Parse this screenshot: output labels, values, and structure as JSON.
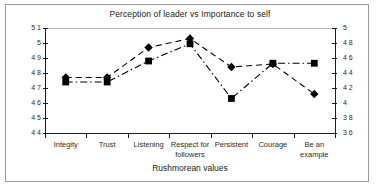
{
  "figure": {
    "border_color": "#9a9a9a",
    "background": "#ffffff"
  },
  "chart_data": {
    "type": "line",
    "title": "Perception of leader vs Importance to self",
    "xlabel": "Rushmorean values",
    "ylabel": "",
    "categories": [
      "Integity",
      "Trust",
      "Listening",
      "Respect for followers",
      "Persistent",
      "Courage",
      "Be an example"
    ],
    "series": [
      {
        "name": "Perception of leader",
        "marker": "diamond",
        "axis": "left",
        "line_style": "dashed",
        "color": "#000000",
        "values": [
          4.77,
          4.77,
          4.97,
          5.03,
          4.84,
          4.86,
          4.66
        ]
      },
      {
        "name": "Importance to self",
        "marker": "square",
        "axis": "right",
        "line_style": "dash-dot",
        "color": "#000000",
        "values": [
          4.28,
          4.28,
          4.56,
          4.79,
          4.06,
          4.53,
          4.53
        ]
      }
    ],
    "left_axis": {
      "min": 4.4,
      "max": 5.1,
      "ticks": [
        "5 1",
        "5",
        "4 9",
        "4 8",
        "4 7",
        "4 6",
        "4 5",
        "4 4"
      ],
      "tick_values": [
        5.1,
        5.0,
        4.9,
        4.8,
        4.7,
        4.6,
        4.5,
        4.4
      ]
    },
    "right_axis": {
      "min": 3.6,
      "max": 5.0,
      "ticks": [
        "5",
        "4 8",
        "4 6",
        "4 4",
        "4 2",
        "4",
        "3 8",
        "3 6"
      ],
      "tick_values": [
        5.0,
        4.8,
        4.6,
        4.4,
        4.2,
        4.0,
        3.8,
        3.6
      ]
    },
    "grid": false,
    "legend": "none"
  }
}
